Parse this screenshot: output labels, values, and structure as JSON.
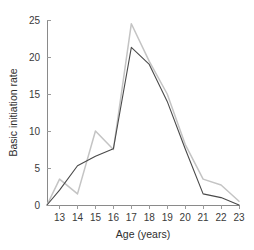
{
  "chart_data": {
    "type": "line",
    "title": "",
    "subtitle": "",
    "xlabel": "Age (years)",
    "ylabel": "Basic initiation rate",
    "x": [
      13,
      14,
      15,
      16,
      17,
      18,
      19,
      20,
      21,
      22,
      23
    ],
    "xlim": [
      12.3,
      23
    ],
    "ylim": [
      0,
      25
    ],
    "xticks": [
      13,
      14,
      15,
      16,
      17,
      18,
      19,
      20,
      21,
      22,
      23
    ],
    "xtick_labels": [
      "13",
      "14",
      "15",
      "16",
      "17",
      "18",
      "19",
      "20",
      "21",
      "22",
      "23"
    ],
    "yticks": [
      0,
      5,
      10,
      15,
      20,
      25
    ],
    "ytick_labels": [
      "0",
      "5",
      "10",
      "15",
      "20",
      "25"
    ],
    "grid": false,
    "legend": "none",
    "origin_x": 12.3,
    "series": [
      {
        "name": "dark-series",
        "color": "#4a4a4a",
        "width": 1.1,
        "x": [
          12.3,
          13,
          14,
          15,
          16,
          17,
          18,
          19,
          20,
          21,
          22,
          23
        ],
        "values": [
          0,
          2.0,
          5.3,
          6.6,
          7.6,
          21.3,
          19.0,
          14.0,
          7.6,
          1.5,
          1.0,
          0
        ]
      },
      {
        "name": "light-series",
        "color": "#c4c4c4",
        "width": 1.5,
        "x": [
          12.3,
          13,
          14,
          15,
          16,
          17,
          18,
          19,
          20,
          21,
          22,
          23
        ],
        "values": [
          0,
          3.5,
          1.5,
          10.0,
          7.5,
          24.5,
          19.4,
          15.0,
          8.2,
          3.5,
          2.7,
          0.5
        ]
      }
    ]
  }
}
